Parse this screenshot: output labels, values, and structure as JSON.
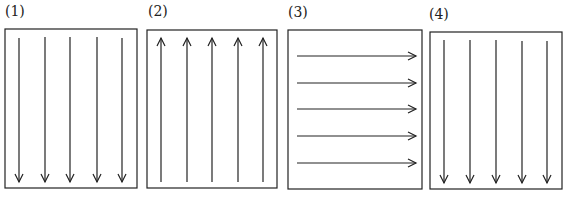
{
  "panels": [
    {
      "label": "(1)",
      "direction": "down",
      "arrow_count": 5
    },
    {
      "label": "(2)",
      "direction": "up",
      "arrow_count": 5
    },
    {
      "label": "(3)",
      "direction": "right",
      "arrow_count": 5
    },
    {
      "label": "(4)",
      "direction": "down",
      "arrow_count": 5
    }
  ],
  "colors": {
    "stroke": "#222222",
    "background": "#ffffff"
  }
}
